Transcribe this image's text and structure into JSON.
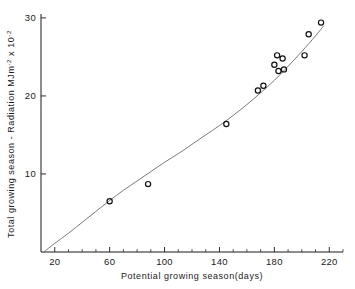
{
  "chart_data": {
    "type": "scatter",
    "title": "",
    "subtitle": "",
    "xlabel": "Potential growing season(days)",
    "ylabel_parts": {
      "main": "Total growing season - Radiation MJm",
      "sup1": "-2",
      "mid": " x 10",
      "sup2": "-2"
    },
    "ylabel": "Total growing season - Radiation MJm-2 x 10-2",
    "xlim": [
      10,
      230
    ],
    "ylim": [
      0,
      30.5
    ],
    "xticks": [
      20,
      60,
      100,
      140,
      180,
      220
    ],
    "xtick_labels": [
      "20",
      "60",
      "100",
      "140",
      "180",
      "220"
    ],
    "yticks": [
      10,
      20,
      30
    ],
    "ytick_labels": [
      "10",
      "20",
      "30"
    ],
    "x_minor_step": 10,
    "grid": false,
    "legend": false,
    "legend_position": "none",
    "marker": "open-circle",
    "points": [
      {
        "x": 60,
        "y": 6.5
      },
      {
        "x": 88,
        "y": 8.7
      },
      {
        "x": 145,
        "y": 16.4
      },
      {
        "x": 168,
        "y": 20.7
      },
      {
        "x": 172,
        "y": 21.3
      },
      {
        "x": 180,
        "y": 24.0
      },
      {
        "x": 182,
        "y": 25.2
      },
      {
        "x": 183,
        "y": 23.2
      },
      {
        "x": 186,
        "y": 24.8
      },
      {
        "x": 187,
        "y": 23.4
      },
      {
        "x": 202,
        "y": 25.2
      },
      {
        "x": 205,
        "y": 27.9
      },
      {
        "x": 214,
        "y": 29.4
      }
    ],
    "fit_curve": {
      "description": "smooth upward-curving fitted line through data",
      "points": [
        {
          "x": 12,
          "y": 0.0
        },
        {
          "x": 20,
          "y": 1.1
        },
        {
          "x": 30,
          "y": 2.4
        },
        {
          "x": 40,
          "y": 3.8
        },
        {
          "x": 50,
          "y": 5.2
        },
        {
          "x": 60,
          "y": 6.6
        },
        {
          "x": 70,
          "y": 7.9
        },
        {
          "x": 80,
          "y": 9.1
        },
        {
          "x": 90,
          "y": 10.3
        },
        {
          "x": 100,
          "y": 11.5
        },
        {
          "x": 110,
          "y": 12.6
        },
        {
          "x": 120,
          "y": 13.8
        },
        {
          "x": 130,
          "y": 15.0
        },
        {
          "x": 140,
          "y": 16.2
        },
        {
          "x": 150,
          "y": 17.5
        },
        {
          "x": 160,
          "y": 18.9
        },
        {
          "x": 170,
          "y": 20.4
        },
        {
          "x": 180,
          "y": 22.0
        },
        {
          "x": 190,
          "y": 23.8
        },
        {
          "x": 200,
          "y": 25.7
        },
        {
          "x": 210,
          "y": 27.7
        },
        {
          "x": 216,
          "y": 29.0
        }
      ]
    }
  }
}
